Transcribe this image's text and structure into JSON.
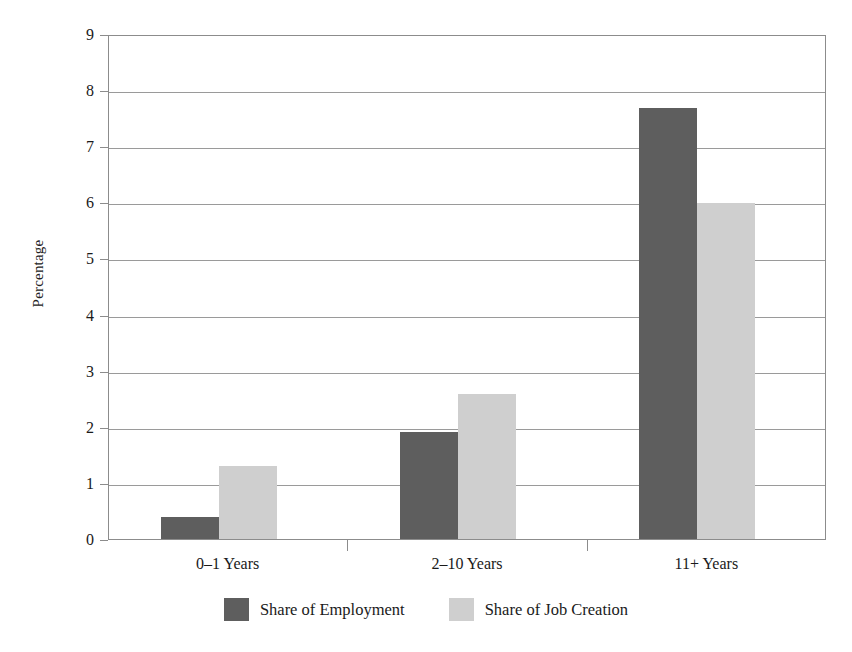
{
  "chart_data": {
    "type": "bar",
    "title": "",
    "subtitle": "",
    "xlabel": "",
    "ylabel": "Percentage",
    "categories": [
      "0–1 Years",
      "2–10 Years",
      "11+ Years"
    ],
    "series": [
      {
        "name": "Share of Employment",
        "color": "#5e5e5e",
        "values": [
          0.4,
          1.9,
          7.68
        ]
      },
      {
        "name": "Share of Job Creation",
        "color": "#cfcfcf",
        "values": [
          1.3,
          2.58,
          5.98
        ]
      }
    ],
    "ylim": [
      0,
      9
    ],
    "yticks": [
      0,
      1,
      2,
      3,
      4,
      5,
      6,
      7,
      8,
      9
    ],
    "ytick_labels": [
      "0",
      "1",
      "2",
      "3",
      "4",
      "5",
      "6",
      "7",
      "8",
      "9"
    ],
    "grid": true,
    "grid_axis": "y",
    "legend_position": "bottom",
    "bar_group_gap": true,
    "annotations": []
  },
  "legend": {
    "items": [
      {
        "label": "Share of Employment",
        "swatch": "dark-swatch-icon"
      },
      {
        "label": "Share of Job Creation",
        "swatch": "light-swatch-icon"
      }
    ]
  },
  "axes": {
    "y_title": "Percentage"
  }
}
